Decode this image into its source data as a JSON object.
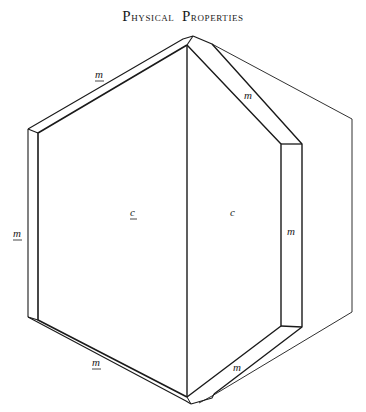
{
  "page": {
    "title_parts": [
      {
        "cap": "P",
        "rest": "hysical"
      },
      {
        "cap": "P",
        "rest": "roperties"
      }
    ]
  },
  "diagram": {
    "faces": [
      {
        "id": "c-front",
        "label": "c",
        "underlined": true,
        "x": 133,
        "y": 216
      },
      {
        "id": "c-back",
        "label": "c",
        "underlined": false,
        "x": 232,
        "y": 214
      },
      {
        "id": "m-top-left",
        "label": "m",
        "underlined": true,
        "x": 98,
        "y": 77
      },
      {
        "id": "m-left",
        "label": "m",
        "underlined": true,
        "x": 18,
        "y": 236
      },
      {
        "id": "m-bottom-left",
        "label": "m",
        "underlined": true,
        "x": 98,
        "y": 365
      },
      {
        "id": "m-top-right",
        "label": "m",
        "underlined": false,
        "x": 248,
        "y": 98
      },
      {
        "id": "m-right",
        "label": "m",
        "underlined": false,
        "x": 291,
        "y": 233
      },
      {
        "id": "m-bottom-right",
        "label": "m",
        "underlined": false,
        "x": 236,
        "y": 370
      }
    ],
    "line_color": "#1a1a1a"
  }
}
